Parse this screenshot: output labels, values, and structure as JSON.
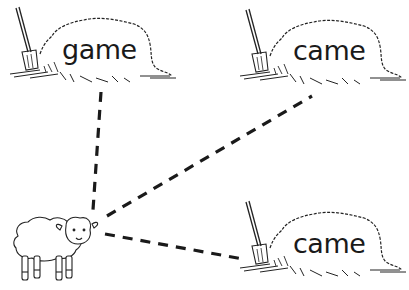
{
  "worksheet": {
    "haystacks": [
      {
        "id": "top-left",
        "word": "game"
      },
      {
        "id": "top-right",
        "word": "came"
      },
      {
        "id": "bottom-right",
        "word": "came"
      }
    ],
    "character": "sheep-icon",
    "connectors": [
      {
        "from": "sheep",
        "to": "top-left",
        "style": "dashed"
      },
      {
        "from": "sheep",
        "to": "top-right",
        "style": "dashed"
      },
      {
        "from": "sheep",
        "to": "bottom-right",
        "style": "dashed"
      }
    ],
    "colors": {
      "ink": "#1a1a1a",
      "background": "#ffffff"
    }
  }
}
